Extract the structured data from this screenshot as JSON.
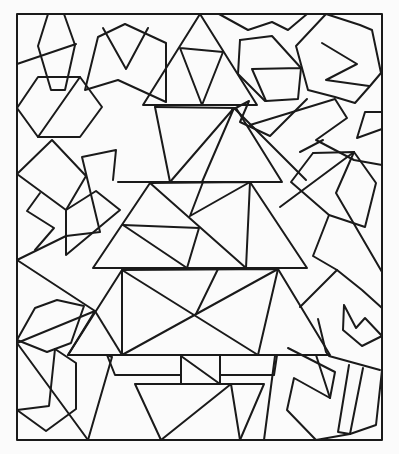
{
  "artwork": {
    "subject": "Geometric christmas tree coloring page",
    "line_color": "#1a1a1a",
    "background": "#fbfbfb",
    "frame": {
      "x1": 17,
      "y1": 14,
      "x2": 382,
      "y2": 440
    }
  },
  "shapes": [
    {
      "name": "frame",
      "points": "17,14 382,14 382,440 17,440 17,14"
    },
    {
      "name": "tree-tier-1",
      "points": "200,14 143,105 257,105 200,14"
    },
    {
      "name": "tree-tier-1-inner",
      "points": "180,48 223,52 202,105 180,48"
    },
    {
      "name": "tree-tier-2",
      "points": "118,182 282,182 236,108 155,107"
    },
    {
      "name": "tree-tier-2-a",
      "points": "155,107 170,182"
    },
    {
      "name": "tree-tier-2-b",
      "points": "170,182 234,108 202,182"
    },
    {
      "name": "tree-tier-2-c",
      "points": "234,108 306,180"
    },
    {
      "name": "tree-tier-3",
      "points": "93,268 307,268 250,182 150,183 93,268"
    },
    {
      "name": "tree-tier-3-a",
      "points": "123,225 199,228 187,268"
    },
    {
      "name": "tree-tier-3-b",
      "points": "123,225 187,268"
    },
    {
      "name": "tree-tier-3-c",
      "points": "150,183 246,268 250,182 190,216 203,182"
    },
    {
      "name": "tree-tier-4",
      "points": "68,355 330,355 278,269 122,270 68,355"
    },
    {
      "name": "tree-tier-4-a",
      "points": "122,270 122,355 278,269 258,355 122,270"
    },
    {
      "name": "tree-tier-4-b",
      "points": "95,311 122,355"
    },
    {
      "name": "tree-tier-4-c",
      "points": "218,269 196,314"
    },
    {
      "name": "pot-left",
      "points": "107,355 115,375 181,375 181,355"
    },
    {
      "name": "pot-center",
      "points": "181,355 181,384 220,384 220,355"
    },
    {
      "name": "pot-diag",
      "points": "181,356 220,384"
    },
    {
      "name": "pot-right",
      "points": "220,375 274,375 277,355"
    },
    {
      "name": "pot-trap",
      "points": "135,384 264,384 240,440 161,440 135,384"
    },
    {
      "name": "pot-trap-a",
      "points": "161,440 231,384 240,440"
    },
    {
      "name": "pot-left-tri",
      "points": "88,440 112,357 107,355"
    },
    {
      "name": "pot-right-bar",
      "points": "275,356 264,440"
    },
    {
      "name": "hex-top-left",
      "points": "85,90 118,80 166,102 166,43 125,24 98,37 85,90"
    },
    {
      "name": "v-shape",
      "points": "103,28 126,69 148,28"
    },
    {
      "name": "kite-top-left",
      "points": "48,14 38,46 51,90 65,90 75,45 64,14"
    },
    {
      "name": "line-tl",
      "points": "17,64 76,44"
    },
    {
      "name": "hex-left",
      "points": "17,108 38,77 80,77 102,107 80,137 38,137 17,108"
    },
    {
      "name": "hex-left-diag",
      "points": "38,137 80,77"
    },
    {
      "name": "quad-left",
      "points": "17,174 52,140 86,176 66,210 17,174"
    },
    {
      "name": "zig-left",
      "points": "40,193 27,211 54,228 35,250"
    },
    {
      "name": "quad-mid-left",
      "points": "66,210 66,255 120,210 96,191 66,210"
    },
    {
      "name": "fan-left",
      "points": "17,260 66,236 100,232 82,157 116,150 113,180"
    },
    {
      "name": "fan-left-b",
      "points": "17,260 95,311"
    },
    {
      "name": "poly-left-b",
      "points": "17,340 35,308 57,300 84,306 71,343 47,352 17,340"
    },
    {
      "name": "left-bottom",
      "points": "17,343 95,311 68,355"
    },
    {
      "name": "left-bottom-kite",
      "points": "55,349 49,406 17,410"
    },
    {
      "name": "left-z",
      "points": "17,410 46,431 76,409 76,363 55,349"
    },
    {
      "name": "left-line",
      "points": "17,343 88,440"
    },
    {
      "name": "zig-top",
      "points": "219,14 248,30 272,22 288,30 307,14"
    },
    {
      "name": "poly-top-mid",
      "points": "240,40 272,36 301,68 298,99 266,101 252,69 301,68"
    },
    {
      "name": "poly-top-mid-b",
      "points": "240,40 238,74 265,101"
    },
    {
      "name": "tri-top-right",
      "points": "232,110 249,101 240,122 270,136 307,99"
    },
    {
      "name": "e-hex",
      "points": "326,14 360,25 372,30 381,73 370,86 355,103 335,97 308,90 296,46 326,14"
    },
    {
      "name": "e-shape",
      "points": "322,43 357,64 326,80 369,86"
    },
    {
      "name": "line-right-a",
      "points": "250,125 335,99 347,118 316,140 354,160 382,165"
    },
    {
      "name": "line-right-b",
      "points": "300,152 323,140"
    },
    {
      "name": "small-right",
      "points": "382,112 365,112 357,138 382,129"
    },
    {
      "name": "hex-right",
      "points": "313,153 354,152 376,183 365,227 329,215 291,182 313,153"
    },
    {
      "name": "right-diag",
      "points": "354,152 336,193 382,272"
    },
    {
      "name": "right-diag-b",
      "points": "354,152 280,207"
    },
    {
      "name": "right-zig",
      "points": "329,215 313,256 337,270 300,307"
    },
    {
      "name": "right-zig-b",
      "points": "337,270 362,290 382,308"
    },
    {
      "name": "right-hex-b",
      "points": "344,305 343,330 362,346 382,336 365,318 356,328 344,305"
    },
    {
      "name": "right-low",
      "points": "318,319 326,352 329,356 380,370"
    },
    {
      "name": "right-bars",
      "points": "349,365 338,432 350,434 363,368"
    },
    {
      "name": "right-bars-b",
      "points": "350,434 376,425 382,370"
    },
    {
      "name": "right-u",
      "points": "288,348 335,372 330,398 294,378 287,410 316,440 350,434"
    },
    {
      "name": "right-u-b",
      "points": "316,355 330,398"
    }
  ]
}
